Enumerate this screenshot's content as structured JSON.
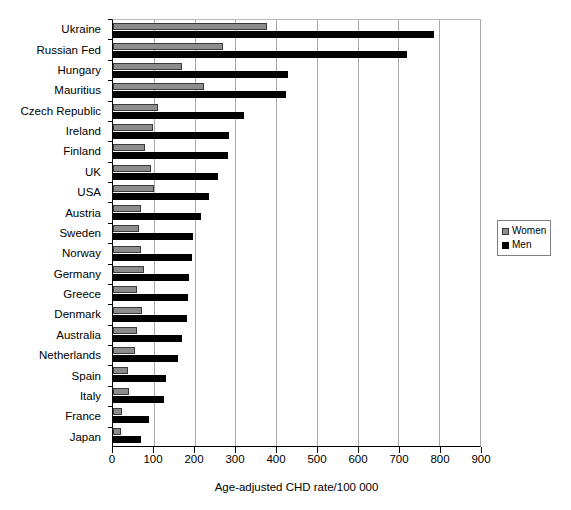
{
  "chart_data": {
    "type": "bar",
    "orientation": "horizontal",
    "title": "",
    "xlabel": "Age-adjusted CHD rate/100 000",
    "ylabel": "",
    "xlim": [
      0,
      900
    ],
    "xticks": [
      0,
      100,
      200,
      300,
      400,
      500,
      600,
      700,
      800,
      900
    ],
    "xtick_labels": [
      "0",
      "100",
      "200",
      "300",
      "400",
      "500",
      "600",
      "700",
      "800",
      "900"
    ],
    "grid": "vertical",
    "legend_position": "right",
    "categories": [
      "Ukraine",
      "Russian Fed",
      "Hungary",
      "Mauritius",
      "Czech Republic",
      "Ireland",
      "Finland",
      "UK",
      "USA",
      "Austria",
      "Sweden",
      "Norway",
      "Germany",
      "Greece",
      "Denmark",
      "Australia",
      "Netherlands",
      "Spain",
      "Italy",
      "France",
      "Japan"
    ],
    "series": [
      {
        "name": "Women",
        "color": "#8c8c8c",
        "values": [
          378,
          270,
          168,
          224,
          110,
          97,
          78,
          93,
          100,
          68,
          64,
          68,
          75,
          60,
          70,
          58,
          54,
          37,
          40,
          22,
          20
        ]
      },
      {
        "name": "Men",
        "color": "#000000",
        "values": [
          788,
          720,
          429,
          424,
          322,
          285,
          281,
          257,
          235,
          217,
          197,
          193,
          186,
          183,
          181,
          170,
          160,
          129,
          125,
          88,
          68
        ]
      }
    ]
  },
  "legend": {
    "entries": [
      {
        "label": "Women",
        "swatch": "women-swatch"
      },
      {
        "label": "Men",
        "swatch": "men-swatch"
      }
    ]
  }
}
